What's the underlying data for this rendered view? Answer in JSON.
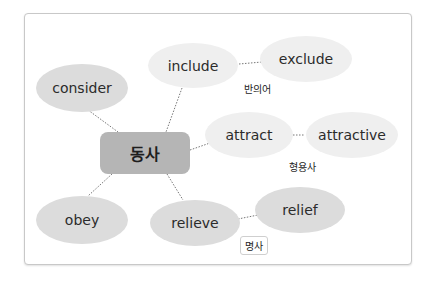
{
  "diagram": {
    "center": "동사",
    "nodes": {
      "consider": "consider",
      "include": "include",
      "exclude": "exclude",
      "attract": "attract",
      "attractive": "attractive",
      "obey": "obey",
      "relieve": "relieve",
      "relief": "relief"
    },
    "labels": {
      "antonym": "반의어",
      "adjective": "형용사",
      "noun": "명사"
    }
  }
}
